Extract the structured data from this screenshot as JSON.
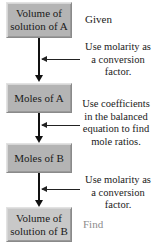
{
  "diagram": {
    "type": "flowchart",
    "boxes": [
      {
        "label": "Volume of solution of A",
        "line1": "Volume of",
        "line2": "solution of A",
        "role": "Given"
      },
      {
        "label": "Moles of A"
      },
      {
        "label": "Moles of B"
      },
      {
        "label": "Volume of solution of B",
        "line1": "Volume of",
        "line2": "solution of B",
        "role": "Find"
      }
    ],
    "side_labels": {
      "given": "Given",
      "find": "Find"
    },
    "annotations": [
      {
        "lines": [
          "Use molarity as",
          "a conversion",
          "factor."
        ],
        "between": [
          "Volume of solution of A",
          "Moles of A"
        ]
      },
      {
        "lines": [
          "Use coefficients",
          "in the balanced",
          "equation to find",
          "mole ratios."
        ],
        "between": [
          "Moles of A",
          "Moles of B"
        ]
      },
      {
        "lines": [
          "Use molarity as",
          "a conversion",
          "factor."
        ],
        "between": [
          "Moles of B",
          "Volume of solution of B"
        ]
      }
    ],
    "colors": {
      "box_fill": "#b4b4b4",
      "box_fill_final": "#c8c8c8",
      "arrow": "#111111",
      "given_text": "#1a1a1a",
      "find_text": "#8c8c8c"
    }
  }
}
